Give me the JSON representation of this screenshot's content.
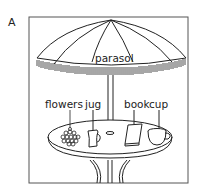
{
  "panel": {
    "letter": "A"
  },
  "labels": {
    "parasol": "parasol",
    "flowers": "flowers",
    "jug": "jug",
    "book": "book",
    "cup": "cup"
  },
  "colors": {
    "stroke": "#222222",
    "background": "#ffffff",
    "frame": "#555555"
  }
}
